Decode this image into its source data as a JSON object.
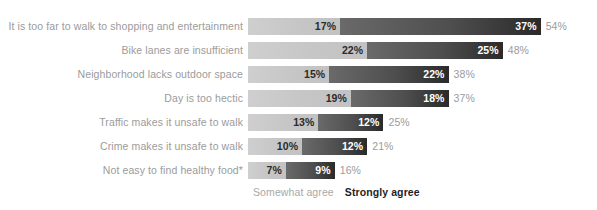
{
  "chart_data": {
    "type": "bar",
    "subtype": "stacked-horizontal-bar",
    "title": "",
    "subtitle": "",
    "xlabel": "",
    "ylabel": "",
    "grid": false,
    "legend_position": "bottom-left",
    "unit": "%",
    "xlim": [
      0,
      54
    ],
    "pixels_per_percent": 5.42,
    "bar_origin_x": 253,
    "categories": [
      "It is too far to walk to shopping and entertainment",
      "Bike lanes are insufficient",
      "Neighborhood lacks outdoor space",
      "Day is too hectic",
      "Traffic makes it unsafe to walk",
      "Crime makes it unsafe to walk",
      "Not easy to find healthy food*"
    ],
    "series": [
      {
        "name": "Somewhat agree",
        "color": "#c6c6c6",
        "values": [
          17,
          22,
          15,
          19,
          13,
          10,
          7
        ],
        "labels": [
          "17%",
          "22%",
          "15%",
          "19%",
          "13%",
          "10%",
          "7%"
        ]
      },
      {
        "name": "Strongly agree",
        "color": "#3a3a3a",
        "values": [
          37,
          25,
          22,
          18,
          12,
          12,
          9
        ],
        "labels": [
          "37%",
          "25%",
          "22%",
          "18%",
          "12%",
          "12%",
          "9%"
        ]
      }
    ],
    "totals": [
      54,
      48,
      38,
      37,
      25,
      21,
      16
    ],
    "total_labels": [
      "54%",
      "48%",
      "38%",
      "37%",
      "25%",
      "21%",
      "16%"
    ]
  },
  "legend": {
    "somewhat_label": "Somewhat agree",
    "strongly_label": "Strongly agree"
  },
  "colors": {
    "somewhat_agree": "#c6c6c6",
    "strongly_agree": "#3a3a3a",
    "category_text": "#9b9b9b",
    "total_text": "#9b9b9b",
    "background": "#ffffff"
  }
}
